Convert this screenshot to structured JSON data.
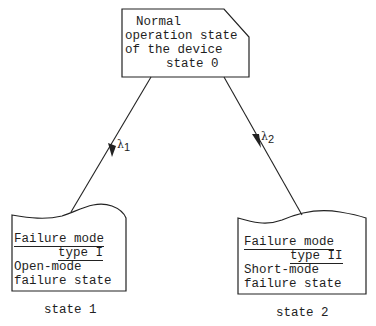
{
  "diagram": {
    "type": "state-transition",
    "nodes": {
      "state0": {
        "lines": [
          "Normal",
          "operation state",
          "of the device",
          "state 0"
        ],
        "shape": "cut-corner-rectangle"
      },
      "state1": {
        "heading": [
          "Failure mode",
          "type I"
        ],
        "description": [
          "Open-mode",
          "failure state"
        ],
        "caption": "state 1",
        "shape": "document-wavy-top"
      },
      "state2": {
        "heading": [
          "Failure mode",
          "type II"
        ],
        "description": [
          "Short-mode",
          "failure state"
        ],
        "caption": "state 2",
        "shape": "document-wavy-top"
      }
    },
    "edges": [
      {
        "from": "state0",
        "to": "state1",
        "symbol": "λ",
        "subscript": "1"
      },
      {
        "from": "state0",
        "to": "state2",
        "symbol": "λ",
        "subscript": "2"
      }
    ],
    "colors": {
      "stroke": "#222222",
      "background": "#ffffff"
    }
  }
}
